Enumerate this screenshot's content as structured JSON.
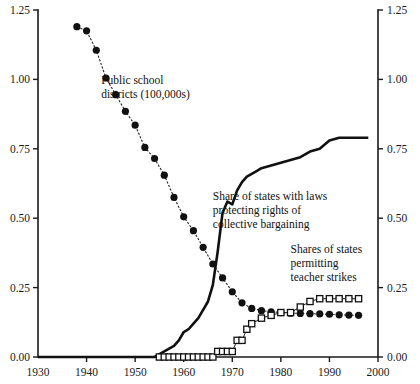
{
  "chart_data": {
    "type": "line",
    "title": "",
    "xlabel": "",
    "ylabel": "",
    "xlim": [
      1930,
      2000
    ],
    "ylim": [
      0.0,
      1.25
    ],
    "grid": false,
    "legend_position": "inline-annotations",
    "x_ticks": [
      1930,
      1940,
      1950,
      1960,
      1970,
      1980,
      1990,
      2000
    ],
    "x_tick_labels": [
      "1930",
      "1940",
      "1950",
      "1960",
      "1970",
      "1980",
      "1990",
      "2000"
    ],
    "y_ticks": [
      0.0,
      0.25,
      0.5,
      0.75,
      1.0,
      1.25
    ],
    "y_tick_labels": [
      "0.00",
      "0.25",
      "0.50",
      "0.75",
      "1.00",
      "1.25"
    ],
    "y_ticks_right": [
      0.0,
      0.25,
      0.5,
      0.75,
      1.0,
      1.25
    ],
    "y_tick_labels_right": [
      "0.00",
      "0.25",
      "0.50",
      "0.75",
      "1.00",
      "1.25"
    ],
    "series": [
      {
        "name": "Public school districts (100,000s)",
        "marker": "filled-circle",
        "line_style": "dashed",
        "x": [
          1938,
          1940,
          1942,
          1944,
          1946,
          1948,
          1950,
          1952,
          1954,
          1956,
          1958,
          1960,
          1962,
          1964,
          1966,
          1968,
          1970,
          1972,
          1974,
          1976,
          1978,
          1980,
          1982,
          1984,
          1986,
          1988,
          1990,
          1992,
          1994,
          1996
        ],
        "values": [
          1.19,
          1.175,
          1.105,
          1.005,
          0.945,
          0.885,
          0.835,
          0.755,
          0.715,
          0.655,
          0.575,
          0.505,
          0.455,
          0.395,
          0.335,
          0.285,
          0.235,
          0.195,
          0.175,
          0.167,
          0.163,
          0.16,
          0.158,
          0.157,
          0.156,
          0.155,
          0.154,
          0.152,
          0.151,
          0.15
        ]
      },
      {
        "name": "Share of states with laws protecting rights of collective bargaining",
        "marker": "none",
        "line_style": "solid",
        "x": [
          1930,
          1954,
          1956,
          1958,
          1959,
          1960,
          1961,
          1962,
          1963,
          1964,
          1965,
          1966,
          1967,
          1968,
          1969,
          1970,
          1971,
          1972,
          1973,
          1974,
          1975,
          1976,
          1978,
          1980,
          1982,
          1984,
          1986,
          1988,
          1990,
          1992,
          1994,
          1996,
          1998
        ],
        "values": [
          0.0,
          0.0,
          0.02,
          0.04,
          0.06,
          0.09,
          0.1,
          0.12,
          0.14,
          0.17,
          0.2,
          0.26,
          0.38,
          0.52,
          0.56,
          0.55,
          0.6,
          0.63,
          0.65,
          0.66,
          0.67,
          0.68,
          0.69,
          0.7,
          0.71,
          0.72,
          0.74,
          0.75,
          0.78,
          0.79,
          0.79,
          0.79,
          0.79
        ]
      },
      {
        "name": "Shares of states permitting teacher strikes",
        "marker": "open-square",
        "line_style": "solid",
        "x": [
          1955,
          1956,
          1957,
          1958,
          1959,
          1960,
          1961,
          1962,
          1963,
          1964,
          1965,
          1966,
          1967,
          1968,
          1969,
          1970,
          1971,
          1972,
          1973,
          1974,
          1976,
          1978,
          1980,
          1982,
          1984,
          1986,
          1988,
          1990,
          1992,
          1994,
          1996
        ],
        "values": [
          0.0,
          0.0,
          0.0,
          0.0,
          0.0,
          0.0,
          0.0,
          0.0,
          0.0,
          0.0,
          0.0,
          0.0,
          0.02,
          0.02,
          0.02,
          0.02,
          0.06,
          0.06,
          0.1,
          0.12,
          0.14,
          0.15,
          0.16,
          0.16,
          0.18,
          0.2,
          0.21,
          0.21,
          0.21,
          0.21,
          0.21
        ]
      }
    ],
    "annotations": [
      {
        "id": "ann-districts",
        "lines": [
          "Public school",
          "districts (100,000s)"
        ],
        "x": 1943.0,
        "y": 0.985
      },
      {
        "id": "ann-bargaining",
        "lines": [
          "Share of states with laws",
          "protecting rights of",
          "collective bargaining"
        ],
        "x": 1966.0,
        "y": 0.565
      },
      {
        "id": "ann-strikes",
        "lines": [
          "Shares of states",
          "permitting",
          "teacher strikes"
        ],
        "x": 1982.0,
        "y": 0.375
      }
    ],
    "colors": {
      "axis": "#1a1a1a",
      "districts_series": "#111111",
      "bargaining_series": "#111111",
      "strikes_series_fill": "#ffffff",
      "strikes_series_stroke": "#111111",
      "background": "#ffffff"
    }
  }
}
